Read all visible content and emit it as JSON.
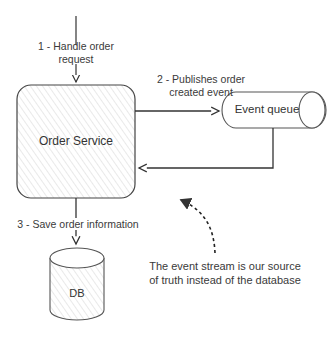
{
  "nodes": {
    "order_service": {
      "label": "Order Service"
    },
    "event_queue": {
      "label": "Event queue"
    },
    "db": {
      "label": "DB"
    }
  },
  "edges": {
    "step1": {
      "line1": "1 - Handle order",
      "line2": "request"
    },
    "step2": {
      "line1": "2 - Publishes order",
      "line2": "created event"
    },
    "step3": {
      "label": "3 - Save order information"
    }
  },
  "annotation": {
    "line1": "The event stream is our source",
    "line2": "of truth instead of the database"
  },
  "colors": {
    "stroke": "#333333",
    "hatch": "#cfcfcf",
    "text": "#3a3a3a"
  }
}
